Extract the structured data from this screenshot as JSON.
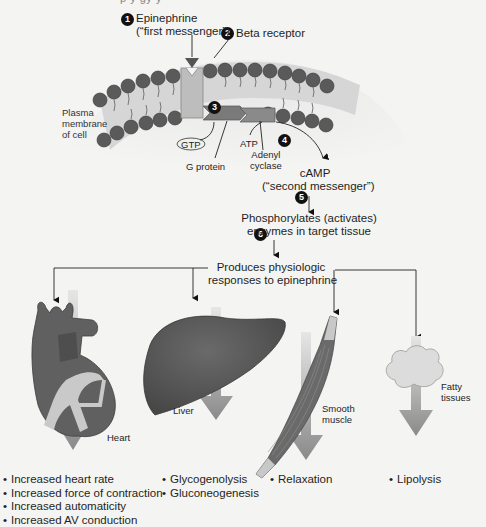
{
  "header": {
    "cropped_text": "p y    gy       y"
  },
  "steps": [
    {
      "num": "1",
      "label_line1": "Epinephrine",
      "label_line2": "(“first messenger”)"
    },
    {
      "num": "2",
      "label": "Beta receptor"
    },
    {
      "num": "3"
    },
    {
      "num": "4"
    },
    {
      "num": "5"
    },
    {
      "num": "6"
    }
  ],
  "membrane": {
    "label_line1": "Plasma",
    "label_line2": "membrane",
    "label_line3": "of cell"
  },
  "molecules": {
    "gtp": "GTP",
    "g_protein": "G protein",
    "atp": "ATP",
    "adenyl_line1": "Adenyl",
    "adenyl_line2": "cyclase",
    "camp_line1": "cAMP",
    "camp_line2": "(“second messenger”)"
  },
  "flow": {
    "phosphorylates_line1": "Phosphorylates (activates)",
    "phosphorylates_line2": "enzymes in target tissue",
    "produces_line1": "Produces physiologic",
    "produces_line2": "responses to epinephrine"
  },
  "organs": {
    "heart": {
      "label": "Heart",
      "effects": [
        "Increased heart rate",
        "Increased force of contraction",
        "Increased automaticity",
        "Increased AV conduction"
      ]
    },
    "liver": {
      "label": "Liver",
      "effects": [
        "Glycogenolysis",
        "Gluconeogenesis"
      ]
    },
    "muscle": {
      "label_line1": "Smooth",
      "label_line2": "muscle",
      "effects": [
        "Relaxation"
      ]
    },
    "fat": {
      "label_line1": "Fatty",
      "label_line2": "tissues",
      "effects": [
        "Lipolysis"
      ]
    }
  },
  "colors": {
    "background": "#f4f4f2",
    "phospholipid_head": "#5a5a5a",
    "membrane_band": "#d2d2d2",
    "receptor": "#bdbdbd",
    "g_protein": "#7a7a7a",
    "organ_dark": "#555555",
    "down_arrow": "#8c8c8c",
    "fat": "#d8d8d8"
  }
}
